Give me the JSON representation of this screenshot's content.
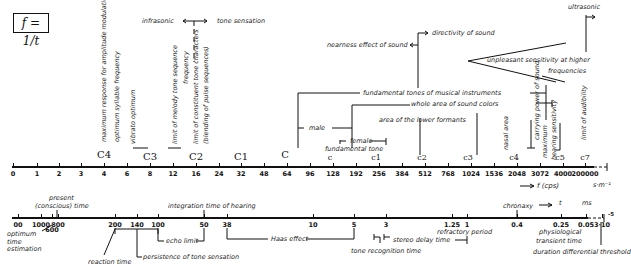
{
  "formula": "f = 1/t",
  "freq_axis": {
    "unit_label": "f  (cps)",
    "end_label": "s·m⁻¹",
    "ticks": [
      "0",
      "1",
      "2",
      "3",
      "4",
      "6",
      "8",
      "12",
      "16",
      "24",
      "32",
      "48",
      "64",
      "96",
      "128",
      "192",
      "256",
      "384",
      "512",
      "768",
      "1024",
      "1536",
      "2048",
      "3072",
      "4000",
      "200000"
    ],
    "notes": [
      "C4",
      "C3",
      "C2",
      "C1",
      "C",
      "c",
      "c1",
      "c2",
      "c3",
      "c4",
      "c5",
      "c7"
    ]
  },
  "time_axis": {
    "unit_t": "t",
    "unit_ms": "ms",
    "exponent": "-5",
    "ticks": [
      "00",
      "1000",
      "600",
      "800",
      "200",
      "140",
      "100",
      "50",
      "38",
      "10",
      "5",
      "3",
      "1.25",
      "1",
      "0.4",
      "0.25",
      "0.05",
      "3·10"
    ]
  },
  "upper_labels": {
    "amp_mod": "maximum response for amplitude modulation",
    "syllable": "optimum syllable frequency",
    "vibrato": "vibrato optimum",
    "melody": "limit of melody tone sequence",
    "frequency": "frequency",
    "constituent": "limit of constituent tone characters",
    "blending": "(blending of pulse sequences)",
    "infrasonic": "infrasonic",
    "tone_sensation": "tone sensation",
    "nearness": "nearness effect of sound",
    "directivity": "directivity of sound",
    "unpleasant": "unpleasant sensitivity at higher",
    "frequencies": "frequencies",
    "ultrasonic": "ultrasonic",
    "fundamental_instr": "fundamental tones of musical instruments",
    "whole_area": "whole area of sound colors",
    "lower_formants": "area of the lower formants",
    "male": "male",
    "female": "female",
    "fundamental_tone": "fundamental tone",
    "nasal": "nasal area",
    "carrying": "carrying power of sound",
    "maximum": "maximum",
    "hearing_sens": "hearing sensitivity",
    "audibility": "limit of audibility"
  },
  "lower_labels": {
    "present": "present",
    "conscious": "(conscious) time",
    "integration": "integration time of hearing",
    "chronaxy": "chronaxy",
    "optimum": "optimum",
    "time": "time",
    "estimation": "estimation",
    "reaction": "reaction time",
    "persistence": "persistence of tone sensation",
    "echo": "echo limit",
    "haas": "Haas effect",
    "stereo": "stereo  delay time",
    "tone_recog": "tone recognition time",
    "refractory": "refractory period",
    "physio1": "physiological",
    "physio2": "transient time",
    "duration": "duration differential threshold"
  }
}
